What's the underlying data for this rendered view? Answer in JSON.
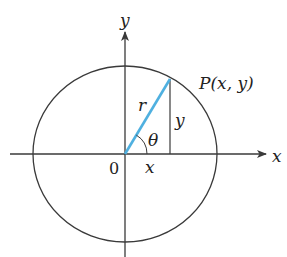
{
  "diagram": {
    "type": "polar-coordinates-circle",
    "colors": {
      "stroke": "#3a3a3a",
      "radius": "#4fb0e0",
      "text": "#222222",
      "background": "#ffffff"
    },
    "labels": {
      "y_axis": "y",
      "x_axis": "x",
      "origin": "0",
      "point": "P(x, y)",
      "radius": "r",
      "vertical_leg": "y",
      "horizontal_leg": "x",
      "angle": "θ"
    },
    "geometry": {
      "origin": [
        125,
        154
      ],
      "circle_rx": 92,
      "circle_ry": 88,
      "point_P": [
        170,
        79
      ]
    }
  }
}
